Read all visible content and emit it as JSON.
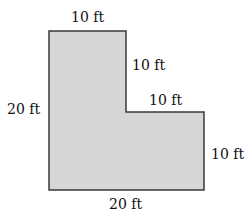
{
  "diagram": {
    "type": "L-shaped floor plan",
    "fill_color": "#d6d6d6",
    "stroke_color": "#3a3a3a",
    "labels": {
      "top": "10 ft",
      "inner_vertical": "10 ft",
      "inner_horizontal": "10 ft",
      "left": "20 ft",
      "right": "10 ft",
      "bottom": "20 ft"
    }
  }
}
